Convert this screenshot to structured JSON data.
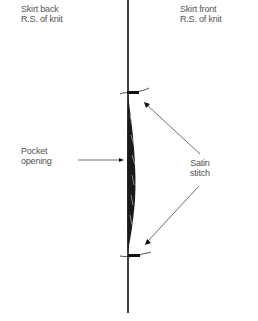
{
  "labels": {
    "skirt_back_line1": "Skirt back",
    "skirt_back_line2": "R.S. of knit",
    "skirt_front_line1": "Skirt front",
    "skirt_front_line2": "R.S. of knit",
    "pocket_line1": "Pocket",
    "pocket_line2": "opening",
    "satin_line1": "Satin",
    "satin_line2": "stitch"
  },
  "colors": {
    "ink": "#111111",
    "label": "#555555",
    "leader": "#333333"
  }
}
